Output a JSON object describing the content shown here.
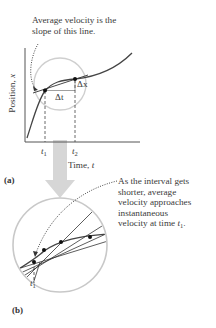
{
  "annotation_top": {
    "line1": "Average velocity is the",
    "line2": "slope of this line."
  },
  "panel_a": {
    "tag": "(a)",
    "y_axis_label": "Position, x",
    "y_axis_text": "Position, ",
    "y_axis_var": "x",
    "x_axis_text": "Time, ",
    "x_axis_var": "t",
    "t1_var": "t",
    "t1_sub": "1",
    "t2_var": "t",
    "t2_sub": "2",
    "delta_t": "Δt",
    "delta_x": "Δx"
  },
  "annotation_bottom": {
    "line1": "As the interval gets",
    "line2": "shorter, average",
    "line3": "velocity approaches",
    "line4": "instantaneous",
    "line5_text": "velocity at time ",
    "line5_var": "t",
    "line5_sub": "1",
    "line5_end": "."
  },
  "panel_b": {
    "tag": "(b)",
    "t1_var": "t",
    "t1_sub": "1"
  },
  "colors": {
    "curve": "#444444",
    "circle": "#c8c8c8",
    "arrow": "#cfcfcf",
    "point": "#111111"
  }
}
